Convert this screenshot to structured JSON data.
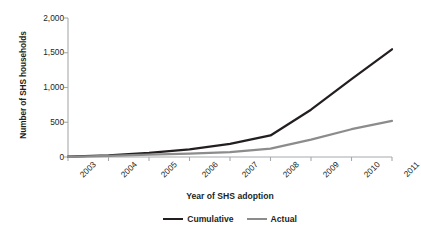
{
  "chart_data": {
    "type": "line",
    "title": "",
    "xlabel": "Year of SHS adoption",
    "ylabel": "Number of SHS households",
    "categories": [
      "2003",
      "2004",
      "2005",
      "2006",
      "2007",
      "2008",
      "2009",
      "2010",
      "2011"
    ],
    "x": [
      2003,
      2004,
      2005,
      2006,
      2007,
      2008,
      2009,
      2010,
      2011
    ],
    "series": [
      {
        "name": "Cumulative",
        "color": "#231f20",
        "values": [
          5,
          25,
          60,
          110,
          190,
          310,
          680,
          1120,
          1550
        ]
      },
      {
        "name": "Actual",
        "color": "#8c8c8c",
        "values": [
          3,
          15,
          35,
          50,
          70,
          120,
          250,
          400,
          520
        ]
      }
    ],
    "ylim": [
      0,
      2000
    ],
    "yticks": [
      0,
      500,
      1000,
      1500,
      2000
    ],
    "ytick_labels": [
      "0",
      "500",
      "1,000",
      "1,500",
      "2,000"
    ],
    "grid": false,
    "legend_position": "bottom"
  },
  "axes": {
    "y_title": "Number of SHS households",
    "x_title": "Year of SHS adoption"
  },
  "legend": {
    "items": [
      {
        "label": "Cumulative",
        "swatch": "line-swatch-dark"
      },
      {
        "label": "Actual",
        "swatch": "line-swatch-gray"
      }
    ]
  }
}
